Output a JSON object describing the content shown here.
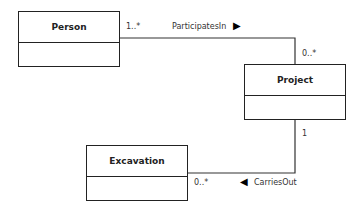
{
  "classes": {
    "person": {
      "name": "Person"
    },
    "project": {
      "name": "Project"
    },
    "excavation": {
      "name": "Excavation"
    }
  },
  "associations": {
    "participates": {
      "label": "ParticipatesIn",
      "arrow": "▶",
      "source_mult": "1..*",
      "target_mult": "0..*"
    },
    "carries": {
      "label": "CarriesOut",
      "arrow": "◀",
      "source_mult": "1",
      "target_mult": "0..*"
    }
  }
}
